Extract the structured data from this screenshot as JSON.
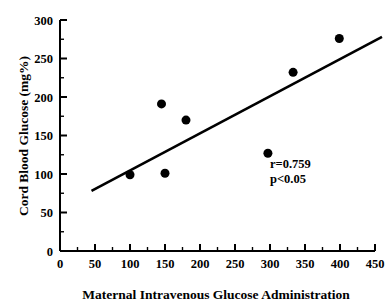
{
  "chart_data": {
    "type": "scatter",
    "title": "",
    "xlabel": "Maternal Intravenous Glucose Administration",
    "ylabel": "Cord Blood Glucose (mg%)",
    "xlim": [
      0,
      450
    ],
    "ylim": [
      0,
      300
    ],
    "x_major_step": 50,
    "x_minor_step": 25,
    "y_major_step": 50,
    "y_minor_step": 25,
    "grid": false,
    "legend": null,
    "x_ticks": [
      "0",
      "50",
      "100",
      "150",
      "200",
      "250",
      "300",
      "350",
      "400",
      "450"
    ],
    "y_ticks": [
      "0",
      "50",
      "100",
      "150",
      "200",
      "250",
      "300"
    ],
    "x_tick_values": [
      0,
      50,
      100,
      150,
      200,
      250,
      300,
      350,
      400,
      450
    ],
    "y_tick_values": [
      0,
      50,
      100,
      150,
      200,
      250,
      300
    ],
    "points": [
      {
        "x": 100,
        "y": 99
      },
      {
        "x": 145,
        "y": 191
      },
      {
        "x": 150,
        "y": 101
      },
      {
        "x": 180,
        "y": 170
      },
      {
        "x": 297,
        "y": 127
      },
      {
        "x": 333,
        "y": 232
      },
      {
        "x": 399,
        "y": 276
      }
    ],
    "marker": {
      "shape": "circle",
      "size_px": 9,
      "color": "#000000"
    },
    "trendline": {
      "type": "linear-fit",
      "x_start": 45,
      "y_start": 78,
      "x_end": 460,
      "y_end": 278,
      "color": "#000000",
      "width_px": 2.6
    },
    "annotations": [
      {
        "name": "correlation",
        "text": "r=0.759",
        "x": 300,
        "y": 108
      },
      {
        "name": "p-value",
        "text": "p<0.05",
        "x": 300,
        "y": 88
      }
    ]
  },
  "figure": {
    "background": "#ffffff",
    "axis_color": "#000000"
  }
}
